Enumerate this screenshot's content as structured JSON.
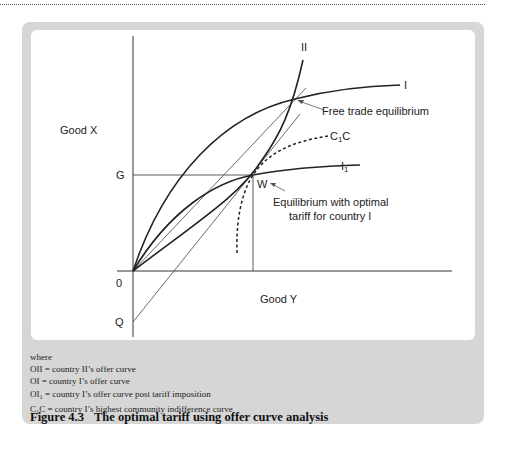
{
  "figure": {
    "number": "Figure 4.3",
    "title": "The optimal tariff using offer curve analysis"
  },
  "axes": {
    "y_label": "Good X",
    "x_label": "Good Y",
    "origin_label": "0",
    "g_label": "G",
    "q_label": "Q"
  },
  "curves": {
    "ii_label": "II",
    "i_label": "I",
    "i1_label_main": "I",
    "i1_label_sub": "1",
    "c1c_label_main": "C",
    "c1c_label_sub": "1",
    "c1c_label_end": "C",
    "w_label": "W"
  },
  "annotations": {
    "free_trade": "Free trade equilibrium",
    "optimal_line1": "Equilibrium with optimal",
    "optimal_line2": "tariff for country I"
  },
  "legend": {
    "intro": "where",
    "items": [
      {
        "key": "OII",
        "key_sub": "",
        "key_after": "",
        "text": " = country II’s offer curve"
      },
      {
        "key": "OI",
        "key_sub": "",
        "key_after": "",
        "text": " = country I’s offer curve"
      },
      {
        "key": "OI",
        "key_sub": "1",
        "key_after": "",
        "text": " = country I’s offer curve post tariff imposition"
      },
      {
        "key": "C",
        "key_sub": "1",
        "key_after": "C",
        "text": " = country I’s highest community indifference curve"
      }
    ]
  },
  "colors": {
    "frame": "#d6d6d6",
    "panel": "#ffffff",
    "ink": "#222222"
  }
}
